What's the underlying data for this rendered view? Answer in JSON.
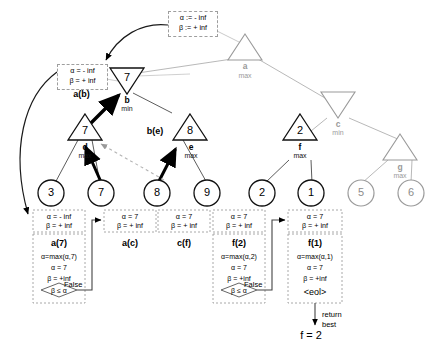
{
  "diagram": {
    "colors": {
      "black": "#000000",
      "gray": "#9a9a9a",
      "light_gray": "#b8b8b8",
      "box_border": "#8e8e8e",
      "white": "#ffffff"
    },
    "init_box": {
      "line1": "α := - inf",
      "line2": "β := + inf"
    },
    "ab_box": {
      "line1": "α = - inf",
      "line2": "β = + inf",
      "label": "a(b)"
    },
    "nodes": [
      {
        "id": "a",
        "name": "a",
        "sub": "max",
        "shape": "triangle-up",
        "value": "",
        "style": "gray"
      },
      {
        "id": "b",
        "name": "b",
        "sub": "min",
        "shape": "triangle-down",
        "value": "7",
        "style": "black"
      },
      {
        "id": "c",
        "name": "c",
        "sub": "min",
        "shape": "triangle-down",
        "value": "",
        "style": "gray"
      },
      {
        "id": "d",
        "name": "d",
        "sub": "max",
        "shape": "triangle-up",
        "value": "7",
        "style": "black"
      },
      {
        "id": "e",
        "name": "e",
        "sub": "max",
        "shape": "triangle-up",
        "value": "8",
        "style": "black"
      },
      {
        "id": "f",
        "name": "f",
        "sub": "max",
        "shape": "triangle-up",
        "value": "2",
        "style": "black"
      },
      {
        "id": "g",
        "name": "g",
        "sub": "max",
        "shape": "triangle-up",
        "value": "",
        "style": "gray"
      }
    ],
    "be_label": "b(e)",
    "leaves": [
      {
        "value": "3",
        "style": "black"
      },
      {
        "value": "7",
        "style": "black"
      },
      {
        "value": "8",
        "style": "black"
      },
      {
        "value": "9",
        "style": "black"
      },
      {
        "value": "2",
        "style": "black"
      },
      {
        "value": "1",
        "style": "black"
      },
      {
        "value": "5",
        "style": "gray"
      },
      {
        "value": "6",
        "style": "gray"
      }
    ],
    "trace_boxes": [
      {
        "id": "a7",
        "alpha": "α = - inf",
        "beta": "β = + inf",
        "title": "a(7)",
        "update": "α=max(α,7)",
        "alpha_new": "α = 7",
        "beta_new": "β = +inf",
        "test": "β ≤ α",
        "test_result": "False"
      },
      {
        "id": "ac",
        "alpha": "α = 7",
        "beta": "β = + inf",
        "title": "a(c)"
      },
      {
        "id": "cf",
        "alpha": "α = 7",
        "beta": "β = + inf",
        "title": "c(f)"
      },
      {
        "id": "f2",
        "alpha": "α = 7",
        "beta": "β = + inf",
        "title": "f(2)",
        "update": "α=max(α,2)",
        "alpha_new": "α = 7",
        "beta_new": "β = +inf",
        "test": "β ≤ α",
        "test_result": "False"
      },
      {
        "id": "f1",
        "alpha": "α = 7",
        "beta": "β = + inf",
        "title": "f(1)",
        "update": "α=max(α,1)",
        "alpha_new": "α = 7",
        "beta_new": "β = +inf",
        "eol": "<eol>"
      }
    ],
    "return_note": {
      "line1": "return",
      "line2": "best"
    },
    "result": "f = 2"
  }
}
